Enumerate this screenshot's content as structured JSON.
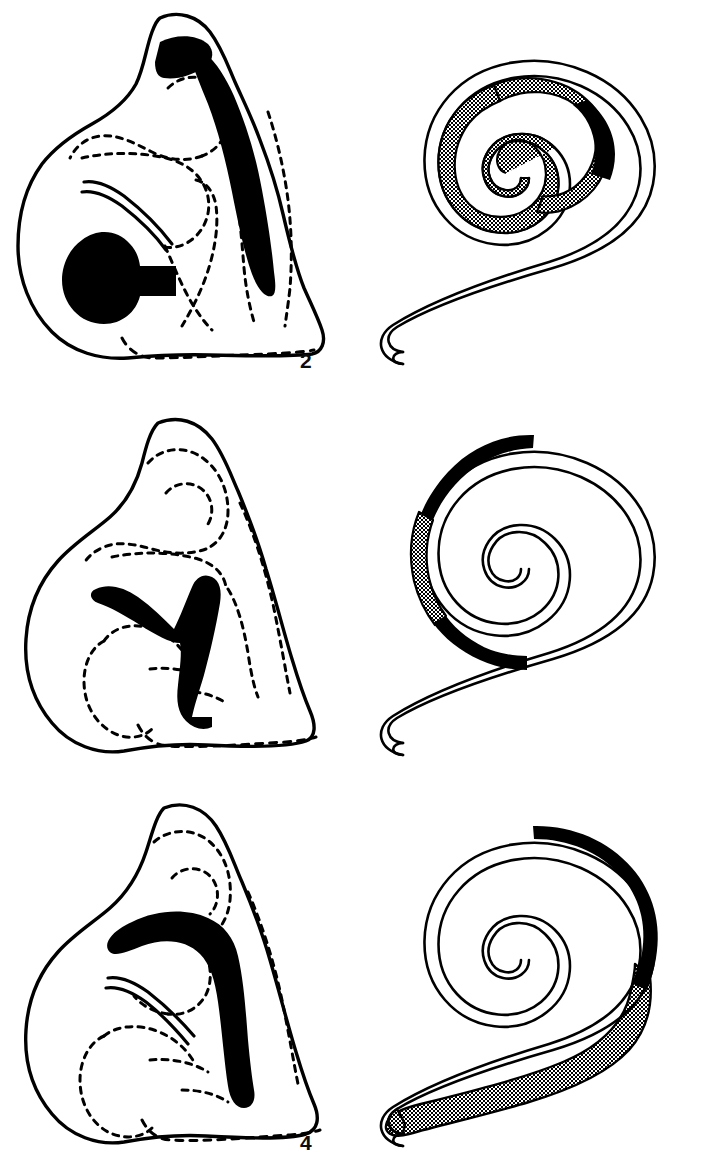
{
  "figure": {
    "background_color": "#ffffff",
    "ink_color": "#000000",
    "stipple_color": "#000000",
    "stipple_background": "#ffffff",
    "panel_count": 6,
    "columns": 2,
    "rows": 3,
    "left_column_type": "cochlear cross-section outline drawing",
    "right_column_type": "spiral schematic of cochlear duct"
  },
  "panels": [
    {
      "id": "panel-2",
      "label": "2",
      "column": "left",
      "row": 1,
      "type": "cross-section",
      "marks": [
        {
          "name": "apical-black-patch",
          "fill": "black",
          "location": "upper turn, apex region"
        },
        {
          "name": "lateral-black-band",
          "fill": "black",
          "location": "long band down the right lateral wall"
        },
        {
          "name": "basal-black-blob",
          "fill": "black",
          "location": "lower-left rounded mass with tail to the right"
        }
      ],
      "solid_outline": "outer capsule boundary",
      "dashed_outline": "internal structures / inner turn boundaries"
    },
    {
      "id": "panel-1",
      "label": "1",
      "column": "right",
      "row": 1,
      "type": "spiral",
      "turns": 2.6,
      "tail": "basal tail extends to the lower left with rounded tip",
      "segments": [
        {
          "name": "stippled-apical-segment",
          "fill": "stipple",
          "extent": "inner/apical turn, from approximately 60° around through the apex to the centre"
        },
        {
          "name": "black-segment",
          "fill": "black",
          "extent": "short arc just basal to the stippled zone, upper right of the inner turn"
        },
        {
          "name": "unmarked-outer-turns",
          "fill": "white",
          "extent": "all outer turns and the tail"
        }
      ]
    },
    {
      "id": "panel-4",
      "label": "4",
      "column": "left",
      "row": 2,
      "type": "cross-section",
      "marks": [
        {
          "name": "y-shaped-black-lesion",
          "fill": "black",
          "location": "central, a Y / wishbone shape with one arm to the upper left and the stem running down to the lower right"
        }
      ],
      "solid_outline": "outer capsule boundary",
      "dashed_outline": "internal structures / inner turn boundaries"
    },
    {
      "id": "panel-3",
      "label": "3",
      "column": "right",
      "row": 2,
      "type": "spiral",
      "turns": 2.6,
      "tail": "basal tail extends to the lower left with rounded tip",
      "segments": [
        {
          "name": "black-upper-segment",
          "fill": "black",
          "extent": "outer turn, from the top (12 o'clock) counter-clockwise to about 10 o'clock"
        },
        {
          "name": "stippled-segment",
          "fill": "stipple",
          "extent": "outer turn, left flank from about 10 o'clock to about 8 o'clock"
        },
        {
          "name": "black-lower-segment",
          "fill": "black",
          "extent": "outer turn, from about 8 o'clock to about 6 o'clock"
        },
        {
          "name": "unmarked-inner-turns",
          "fill": "white",
          "extent": "all inner turns, the apex and the tail"
        }
      ]
    },
    {
      "id": "panel-6",
      "label": "6",
      "column": "left",
      "row": 3,
      "type": "cross-section",
      "marks": [
        {
          "name": "hook-shaped-black-band",
          "fill": "black",
          "location": "broad band running from the mid-left horizontally, then turning down the right side to the basal region"
        }
      ],
      "solid_outline": "outer capsule boundary",
      "dashed_outline": "internal structures / inner turn boundaries"
    },
    {
      "id": "panel-5",
      "label": "5",
      "column": "right",
      "row": 3,
      "type": "spiral",
      "turns": 2.6,
      "tail": "basal tail extends to the lower left with rounded tip",
      "segments": [
        {
          "name": "black-segment",
          "fill": "black",
          "extent": "outer turn, from the top (12 o'clock) clockwise down the right flank to about 4 o'clock"
        },
        {
          "name": "stippled-basal-segment",
          "fill": "stipple",
          "extent": "from about 4 o'clock continuing along the whole basal tail to the rounded tip"
        },
        {
          "name": "unmarked-inner-turns",
          "fill": "white",
          "extent": "all inner turns and the apex"
        }
      ]
    }
  ],
  "legend_key": {
    "black": "total loss / complete lesion",
    "stipple": "partial loss / intermediate lesion",
    "white": "intact"
  }
}
